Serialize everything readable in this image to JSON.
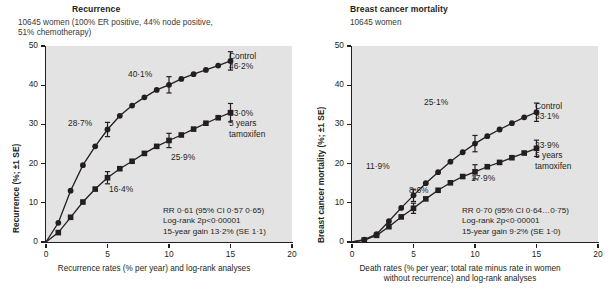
{
  "figure": {
    "width": 609,
    "height": 298,
    "background": "#ffffff",
    "plot_background": "#e3e3e3",
    "ink_color": "#231f20"
  },
  "panels": [
    {
      "id": "recurrence",
      "title": "Recurrence",
      "subtitle": "10645 women (100% ER positive, 44% node positive,\n51% chemotherapy)",
      "ylabel": "Recurrence (%; ±1 SE)",
      "xcaption": "Recurrence rates (% per year) and log-rank analyses",
      "yticks": [
        "0",
        "10",
        "20",
        "30",
        "40",
        "50"
      ],
      "xticks": [
        "0",
        "5",
        "10",
        "15",
        "20"
      ],
      "end_labels": [
        {
          "name": "control",
          "text": "Control\n46·2%"
        },
        {
          "name": "tamoxifen",
          "text": "33·0%\n5 years\ntamoxifen"
        }
      ],
      "point_labels": [
        {
          "name": "control-5yr",
          "text": "28·7%"
        },
        {
          "name": "control-10yr",
          "text": "40·1%"
        },
        {
          "name": "tamoxifen-5yr",
          "text": "16·4%"
        },
        {
          "name": "tamoxifen-10yr",
          "text": "25·9%"
        }
      ],
      "stats": "RR 0·61 (95% CI 0·57   0·65)\nLog-rank 2p<0·00001\n15-year gain 13·2% (SE 1·1)"
    },
    {
      "id": "mortality",
      "title": "Breast cancer mortality",
      "subtitle": "10645 women",
      "ylabel": "Breast cancer mortality (%; ±1 SE)",
      "xcaption": "Death rates (% per year; total rate minus rate in women\nwithout recurrence) and log-rank analyses",
      "yticks": [
        "0",
        "10",
        "20",
        "30",
        "40",
        "50"
      ],
      "xticks": [
        "0",
        "5",
        "10",
        "15",
        "20"
      ],
      "end_labels": [
        {
          "name": "control",
          "text": "Control\n33·1%"
        },
        {
          "name": "tamoxifen",
          "text": "23·9%\n5 years\ntamoxifen"
        }
      ],
      "point_labels": [
        {
          "name": "control-5yr",
          "text": "11·9%"
        },
        {
          "name": "control-10yr",
          "text": "25·1%"
        },
        {
          "name": "tamoxifen-5yr",
          "text": "8·6%"
        },
        {
          "name": "tamoxifen-10yr",
          "text": "17·9%"
        }
      ],
      "stats": "RR 0·70 (95% CI 0·64…0·75)\nLog-rank 2p<0·00001\n15-year gain 9·2% (SE 1·0)"
    }
  ],
  "chart_data": [
    {
      "type": "line",
      "id": "recurrence",
      "title": "Recurrence",
      "subtitle": "10645 women (100% ER positive, 44% node positive, 51% chemotherapy)",
      "xlabel": "Recurrence rates (% per year) and log-rank analyses",
      "ylabel": "Recurrence (%; ±1 SE)",
      "xlim": [
        0,
        20
      ],
      "ylim": [
        0,
        50
      ],
      "xticks": [
        0,
        5,
        10,
        15,
        20
      ],
      "yticks": [
        0,
        10,
        20,
        30,
        40,
        50
      ],
      "grid": false,
      "legend": "inline end-of-curve labels",
      "series": [
        {
          "name": "Control",
          "marker": "circle",
          "x": [
            0,
            1,
            2,
            3,
            4,
            5,
            6,
            7,
            8,
            9,
            10,
            11,
            12,
            13,
            14,
            15
          ],
          "values": [
            0,
            4.9,
            13.1,
            19.6,
            24.4,
            28.7,
            32.2,
            34.8,
            36.9,
            38.8,
            40.1,
            41.6,
            42.8,
            43.9,
            45.0,
            46.2
          ],
          "errorbar_points": [
            {
              "x": 5,
              "y": 28.7,
              "se": 0.7
            },
            {
              "x": 10,
              "y": 40.1,
              "se": 0.8
            },
            {
              "x": 15,
              "y": 46.2,
              "se": 0.9
            }
          ],
          "final_value": 46.2,
          "label": "Control 46·2%"
        },
        {
          "name": "5 years tamoxifen",
          "marker": "square",
          "x": [
            0,
            1,
            2,
            3,
            4,
            5,
            6,
            7,
            8,
            9,
            10,
            11,
            12,
            13,
            14,
            15
          ],
          "values": [
            0,
            2.4,
            6.3,
            10.2,
            13.5,
            16.4,
            18.7,
            20.6,
            22.6,
            24.4,
            25.9,
            27.3,
            28.8,
            30.3,
            31.7,
            33.0
          ],
          "errorbar_points": [
            {
              "x": 5,
              "y": 16.4,
              "se": 0.6
            },
            {
              "x": 10,
              "y": 25.9,
              "se": 0.7
            },
            {
              "x": 15,
              "y": 33.0,
              "se": 0.9
            }
          ],
          "final_value": 33.0,
          "label": "33·0% 5 years tamoxifen"
        }
      ],
      "annotations": [
        "RR 0·61 (95% CI 0·57   0·65)",
        "Log-rank 2p<0·00001",
        "15-year gain 13·2% (SE 1·1)"
      ]
    },
    {
      "type": "line",
      "id": "mortality",
      "title": "Breast cancer mortality",
      "subtitle": "10645 women",
      "xlabel": "Death rates (% per year; total rate minus rate in women without recurrence) and log-rank analyses",
      "ylabel": "Breast cancer mortality (%; ±1 SE)",
      "xlim": [
        0,
        20
      ],
      "ylim": [
        0,
        50
      ],
      "xticks": [
        0,
        5,
        10,
        15,
        20
      ],
      "yticks": [
        0,
        10,
        20,
        30,
        40,
        50
      ],
      "grid": false,
      "legend": "inline end-of-curve labels",
      "series": [
        {
          "name": "Control",
          "marker": "circle",
          "x": [
            0,
            1,
            2,
            3,
            4,
            5,
            6,
            7,
            8,
            9,
            10,
            11,
            12,
            13,
            14,
            15
          ],
          "values": [
            0,
            0.6,
            2.0,
            5.3,
            8.7,
            11.9,
            15.0,
            17.8,
            20.5,
            22.9,
            25.1,
            27.0,
            28.7,
            30.3,
            31.8,
            33.1
          ],
          "errorbar_points": [
            {
              "x": 5,
              "y": 11.9,
              "se": 0.6
            },
            {
              "x": 10,
              "y": 25.1,
              "se": 0.8
            },
            {
              "x": 15,
              "y": 33.1,
              "se": 0.9
            }
          ],
          "final_value": 33.1,
          "label": "Control 33·1%"
        },
        {
          "name": "5 years tamoxifen",
          "marker": "square",
          "x": [
            0,
            1,
            2,
            3,
            4,
            5,
            6,
            7,
            8,
            9,
            10,
            11,
            12,
            13,
            14,
            15
          ],
          "values": [
            0,
            0.5,
            1.7,
            3.9,
            6.4,
            8.6,
            11.0,
            13.2,
            15.1,
            16.7,
            17.9,
            19.2,
            20.3,
            21.5,
            22.7,
            23.9
          ],
          "errorbar_points": [
            {
              "x": 5,
              "y": 8.6,
              "se": 0.5
            },
            {
              "x": 10,
              "y": 17.9,
              "se": 0.7
            },
            {
              "x": 15,
              "y": 23.9,
              "se": 0.8
            }
          ],
          "final_value": 23.9,
          "label": "23·9% 5 years tamoxifen"
        }
      ],
      "annotations": [
        "RR 0·70 (95% CI 0·64…0·75)",
        "Log-rank 2p<0·00001",
        "15-year gain 9·2% (SE 1·0)"
      ]
    }
  ]
}
